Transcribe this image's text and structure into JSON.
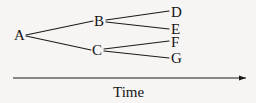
{
  "figure": {
    "background_color": "#f6f5f3",
    "stroke_color": "#1a1a1a",
    "text_color": "#141414"
  },
  "chart_data": {
    "type": "diagram",
    "title": "",
    "xlabel": "Time",
    "ylabel": "",
    "nodes": [
      {
        "id": "A",
        "label": "A",
        "x": 19,
        "y": 35,
        "text_x": 14,
        "text_y": 28
      },
      {
        "id": "B",
        "label": "B",
        "x": 99,
        "y": 21,
        "text_x": 94,
        "text_y": 14
      },
      {
        "id": "C",
        "label": "C",
        "x": 97,
        "y": 50,
        "text_x": 92,
        "text_y": 43
      },
      {
        "id": "D",
        "label": "D",
        "x": 176,
        "y": 12,
        "text_x": 171,
        "text_y": 5
      },
      {
        "id": "E",
        "label": "E",
        "x": 176,
        "y": 29,
        "text_x": 171,
        "text_y": 22
      },
      {
        "id": "F",
        "label": "F",
        "x": 176,
        "y": 42,
        "text_x": 171,
        "text_y": 35
      },
      {
        "id": "G",
        "label": "G",
        "x": 176,
        "y": 58,
        "text_x": 171,
        "text_y": 51
      }
    ],
    "edges": [
      {
        "from": "A",
        "to": "B",
        "x1": 26,
        "y1": 35,
        "x2": 93,
        "y2": 21
      },
      {
        "from": "A",
        "to": "C",
        "x1": 26,
        "y1": 36,
        "x2": 91,
        "y2": 50
      },
      {
        "from": "B",
        "to": "D",
        "x1": 106,
        "y1": 20,
        "x2": 169,
        "y2": 11
      },
      {
        "from": "B",
        "to": "E",
        "x1": 106,
        "y1": 22,
        "x2": 169,
        "y2": 29
      },
      {
        "from": "C",
        "to": "F",
        "x1": 104,
        "y1": 49,
        "x2": 169,
        "y2": 41
      },
      {
        "from": "C",
        "to": "G",
        "x1": 104,
        "y1": 51,
        "x2": 169,
        "y2": 58
      }
    ],
    "axis": {
      "orientation": "horizontal",
      "arrow": "right",
      "x_start": 13,
      "x_end": 246,
      "y": 78,
      "caption": "Time",
      "caption_x": 113,
      "caption_y": 85
    }
  }
}
